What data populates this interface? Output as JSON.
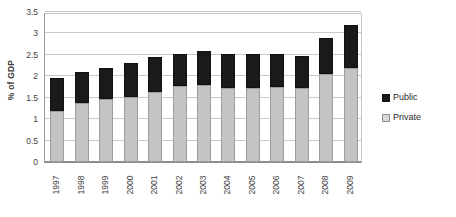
{
  "chart_data": {
    "type": "bar",
    "subtype": "stacked-vertical",
    "title": "",
    "xlabel": "",
    "ylabel": "% of GDP",
    "ylim": [
      0,
      3.5
    ],
    "ytick_step": 0.5,
    "yticks": [
      "3.5",
      "3",
      "2.5",
      "2",
      "1.5",
      "1",
      "0.5",
      "0"
    ],
    "ytick_values": [
      3.5,
      3,
      2.5,
      2,
      1.5,
      1,
      0.5,
      0
    ],
    "grid": true,
    "legend_position": "right",
    "categories": [
      "1997",
      "1998",
      "1999",
      "2000",
      "2001",
      "2002",
      "2003",
      "2004",
      "2005",
      "2006",
      "2007",
      "2008",
      "2009"
    ],
    "series": [
      {
        "name": "Private",
        "color": "#c3c3c3",
        "values": [
          1.2,
          1.37,
          1.47,
          1.52,
          1.63,
          1.77,
          1.8,
          1.73,
          1.72,
          1.75,
          1.72,
          2.05,
          2.2
        ]
      },
      {
        "name": "Public",
        "color": "#1a1a1a",
        "values": [
          0.75,
          0.73,
          0.73,
          0.78,
          0.82,
          0.75,
          0.8,
          0.79,
          0.79,
          0.77,
          0.75,
          0.85,
          1.0
        ]
      }
    ],
    "totals": [
      1.95,
      2.1,
      2.2,
      2.3,
      2.45,
      2.52,
      2.6,
      2.52,
      2.51,
      2.52,
      2.47,
      2.9,
      3.2
    ]
  },
  "legend": {
    "items": [
      {
        "label": "Public",
        "swatch": "public-swatch-icon"
      },
      {
        "label": "Private",
        "swatch": "private-swatch-icon"
      }
    ]
  }
}
